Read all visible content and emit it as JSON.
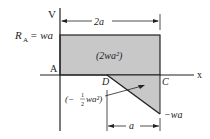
{
  "diagram": {
    "type": "shear-force-diagram",
    "axis": {
      "vertical_label": "V",
      "horizontal_label": "x"
    },
    "labels": {
      "reaction": "R",
      "reaction_sub": "A",
      "reaction_eq": "= wa",
      "point_a": "A",
      "point_d": "D",
      "point_c": "C",
      "upper_area": "(2wa²)",
      "lower_area_open": "(−",
      "lower_area_frac_num": "1",
      "lower_area_frac_den": "2",
      "lower_area_rest": "wa²)",
      "min_value": "−wa",
      "dim_top": "2a",
      "dim_bottom": "a"
    },
    "colors": {
      "fill": "#c8c8c8",
      "line": "#222222"
    },
    "regions": [
      {
        "name": "upper-rectangle",
        "from": "A",
        "to": "C",
        "value": "wa",
        "area": "2wa²"
      },
      {
        "name": "lower-triangle",
        "from": "D",
        "to": "C",
        "value_end": "−wa",
        "area": "−1/2 wa²"
      }
    ]
  }
}
